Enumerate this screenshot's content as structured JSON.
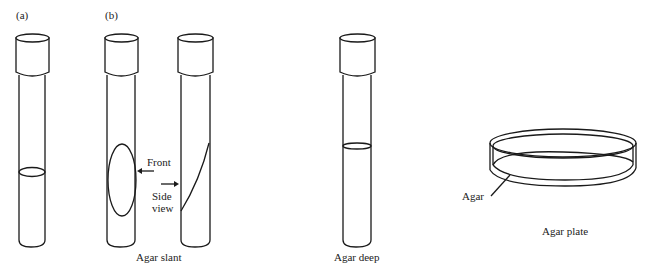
{
  "figure": {
    "panel_labels": {
      "a": "(a)",
      "b": "(b)"
    },
    "annotations": {
      "front": "Front",
      "side_line1": "Side",
      "side_line2": "view",
      "agar_pointer": "Agar"
    },
    "captions": {
      "slant": "Agar slant",
      "deep": "Agar deep",
      "plate": "Agar plate"
    }
  }
}
